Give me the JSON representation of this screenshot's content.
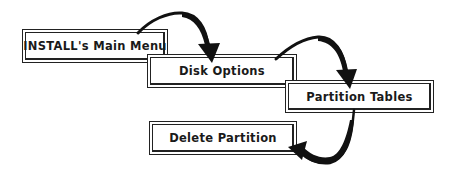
{
  "diagram": {
    "type": "flow",
    "nodes": [
      {
        "id": "main-menu",
        "label": "INSTALL's Main Menu"
      },
      {
        "id": "disk-options",
        "label": "Disk Options"
      },
      {
        "id": "partition-tables",
        "label": "Partition Tables"
      },
      {
        "id": "delete-partition",
        "label": "Delete Partition"
      }
    ],
    "edges": [
      {
        "from": "main-menu",
        "to": "disk-options"
      },
      {
        "from": "disk-options",
        "to": "partition-tables"
      },
      {
        "from": "partition-tables",
        "to": "delete-partition"
      }
    ],
    "colors": {
      "line": "#111111",
      "background": "#ffffff"
    }
  }
}
